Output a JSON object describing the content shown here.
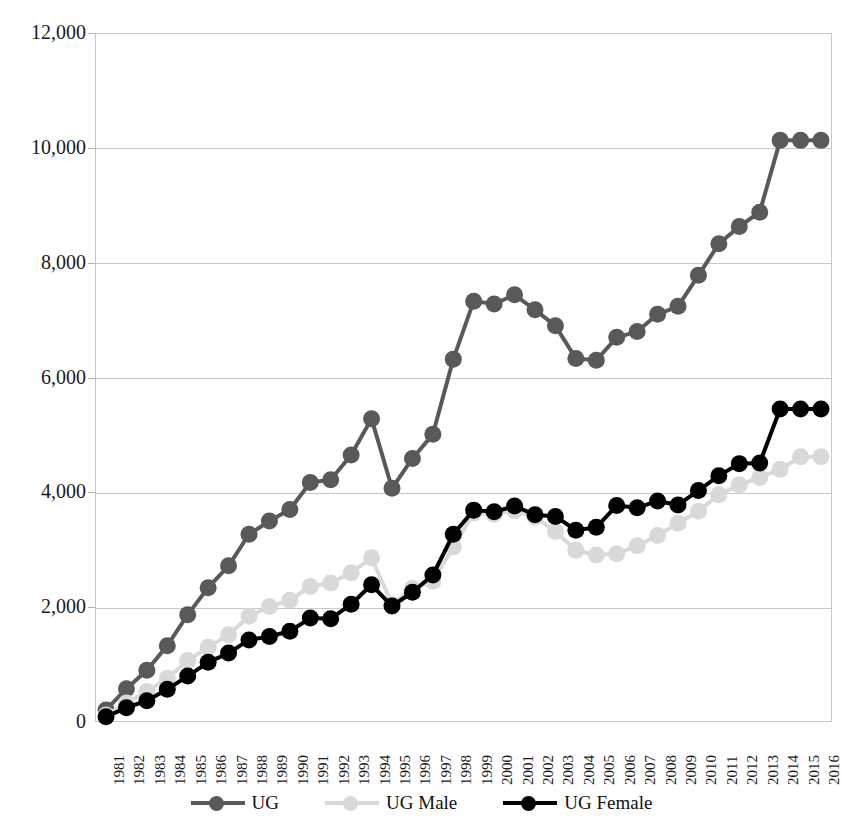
{
  "title": "",
  "legend": {
    "position": "bottom",
    "items": [
      {
        "label": "UG",
        "color": "#595959",
        "name": "legend-ug"
      },
      {
        "label": "UG Male",
        "color": "#d9d9d9",
        "name": "legend-ug-male"
      },
      {
        "label": "UG Female",
        "color": "#000000",
        "name": "legend-ug-female"
      }
    ]
  },
  "axes": {
    "y_ticks": [
      "0",
      "2,000",
      "4,000",
      "6,000",
      "8,000",
      "10,000",
      "12,000"
    ],
    "x_ticks": [
      "1981",
      "1982",
      "1983",
      "1984",
      "1985",
      "1986",
      "1987",
      "1988",
      "1989",
      "1990",
      "1991",
      "1992",
      "1993",
      "1994",
      "1995",
      "1996",
      "1997",
      "1998",
      "1999",
      "2000",
      "2001",
      "2002",
      "2003",
      "2004",
      "2005",
      "2006",
      "2007",
      "2008",
      "2009",
      "2010",
      "2011",
      "2012",
      "2013",
      "2014",
      "2015",
      "2016"
    ]
  },
  "chart_data": {
    "type": "line",
    "title": "",
    "xlabel": "",
    "ylabel": "",
    "ylim": [
      0,
      12000
    ],
    "ytick_step": 2000,
    "grid": true,
    "legend_position": "bottom",
    "marker": "circle",
    "categories": [
      "1981",
      "1982",
      "1983",
      "1984",
      "1985",
      "1986",
      "1987",
      "1988",
      "1989",
      "1990",
      "1991",
      "1992",
      "1993",
      "1994",
      "1995",
      "1996",
      "1997",
      "1998",
      "1999",
      "2000",
      "2001",
      "2002",
      "2003",
      "2004",
      "2005",
      "2006",
      "2007",
      "2008",
      "2009",
      "2010",
      "2011",
      "2012",
      "2013",
      "2014",
      "2015",
      "2016"
    ],
    "series": [
      {
        "name": "UG",
        "color": "#595959",
        "values": [
          210,
          580,
          900,
          1330,
          1870,
          2340,
          2720,
          3270,
          3500,
          3700,
          4170,
          4220,
          4650,
          5280,
          4070,
          4590,
          5010,
          6320,
          7330,
          7280,
          7440,
          7180,
          6900,
          6330,
          6300,
          6700,
          6800,
          7100,
          7240,
          7780,
          8330,
          8630,
          8880,
          10130,
          10130,
          10130
        ]
      },
      {
        "name": "UG Male",
        "color": "#d9d9d9",
        "values": [
          120,
          330,
          530,
          760,
          1070,
          1300,
          1520,
          1840,
          2010,
          2120,
          2360,
          2420,
          2600,
          2860,
          2050,
          2330,
          2450,
          3050,
          3640,
          3620,
          3680,
          3570,
          3320,
          2990,
          2910,
          2930,
          3070,
          3250,
          3460,
          3670,
          3960,
          4130,
          4260,
          4400,
          4620,
          4620
        ]
      },
      {
        "name": "UG Female",
        "color": "#000000",
        "values": [
          90,
          250,
          370,
          570,
          800,
          1040,
          1200,
          1430,
          1490,
          1580,
          1810,
          1800,
          2050,
          2390,
          2020,
          2260,
          2560,
          3270,
          3690,
          3660,
          3760,
          3610,
          3580,
          3340,
          3390,
          3770,
          3730,
          3850,
          3780,
          4030,
          4290,
          4500,
          4510,
          5450,
          5450,
          5450
        ]
      }
    ]
  }
}
